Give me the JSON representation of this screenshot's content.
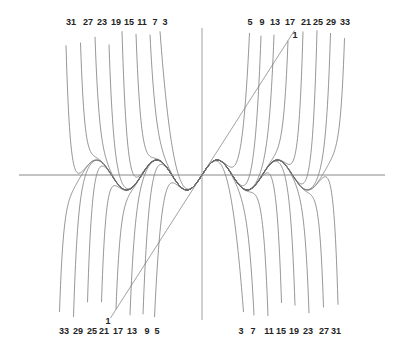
{
  "figure": {
    "function": "sin(x)",
    "degrees": [
      1,
      3,
      5,
      7,
      9,
      11,
      13,
      15,
      17,
      19,
      21,
      23,
      25,
      27,
      29,
      31,
      33
    ],
    "colors": {
      "curve": "#6a6a6a",
      "axis": "#888888",
      "label": "#222222",
      "background": "#ffffff"
    },
    "axes": {
      "origin_px": [
        202,
        175
      ],
      "x_axis_px": [
        19,
        385
      ],
      "y_axis_px": [
        28,
        320
      ],
      "x_scale_px_per_unit": 9.6,
      "y_scale_px_per_unit": 15,
      "clip_y_px": [
        30,
        318
      ]
    }
  },
  "labels": {
    "top_left": [
      {
        "t": "31",
        "x": 71
      },
      {
        "t": "27",
        "x": 88
      },
      {
        "t": "23",
        "x": 102
      },
      {
        "t": "19",
        "x": 116
      },
      {
        "t": "15",
        "x": 129
      },
      {
        "t": "11",
        "x": 142
      },
      {
        "t": "7",
        "x": 155
      },
      {
        "t": "3",
        "x": 165
      }
    ],
    "top_right": [
      {
        "t": "5",
        "x": 250
      },
      {
        "t": "9",
        "x": 262
      },
      {
        "t": "13",
        "x": 275
      },
      {
        "t": "17",
        "x": 290
      },
      {
        "t": "21",
        "x": 306
      },
      {
        "t": "25",
        "x": 318
      },
      {
        "t": "29",
        "x": 331
      },
      {
        "t": "33",
        "x": 345
      }
    ],
    "bottom_left": [
      {
        "t": "33",
        "x": 64
      },
      {
        "t": "29",
        "x": 78
      },
      {
        "t": "25",
        "x": 92
      },
      {
        "t": "21",
        "x": 104
      },
      {
        "t": "17",
        "x": 118
      },
      {
        "t": "13",
        "x": 132
      },
      {
        "t": "9",
        "x": 147
      },
      {
        "t": "5",
        "x": 157
      }
    ],
    "bottom_right": [
      {
        "t": "3",
        "x": 241
      },
      {
        "t": "7",
        "x": 253
      },
      {
        "t": "11",
        "x": 269
      },
      {
        "t": "15",
        "x": 281
      },
      {
        "t": "19",
        "x": 294
      },
      {
        "t": "23",
        "x": 308
      },
      {
        "t": "27",
        "x": 324
      },
      {
        "t": "31",
        "x": 336
      }
    ],
    "degree_one_top": {
      "t": "1",
      "x": 295,
      "y": 30
    },
    "degree_one_bottom": {
      "t": "1",
      "x": 108,
      "y": 316
    },
    "top_row_y": 17,
    "bottom_row_y": 326
  }
}
